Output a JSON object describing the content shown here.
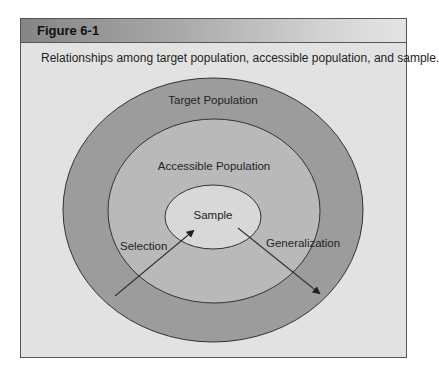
{
  "figure": {
    "title": "Figure 6-1",
    "caption": "Relationships among target population, accessible population, and sample."
  },
  "diagram": {
    "regions": [
      {
        "id": "target",
        "label": "Target Population",
        "fill": "#9c9c9c"
      },
      {
        "id": "accessible",
        "label": "Accessible Population",
        "fill": "#b9b9b9"
      },
      {
        "id": "sample",
        "label": "Sample",
        "fill": "#d8d8d8"
      }
    ],
    "arrows": [
      {
        "id": "selection",
        "label": "Selection",
        "direction": "into sample"
      },
      {
        "id": "generalization",
        "label": "Generalization",
        "direction": "out of sample"
      }
    ]
  },
  "colors": {
    "background": "#e2e2e2",
    "border": "#555555",
    "stroke": "#333333"
  }
}
